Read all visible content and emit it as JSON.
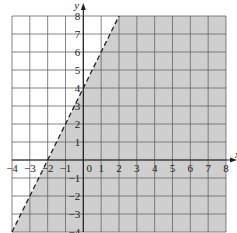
{
  "chart_data": {
    "type": "inequality-graph",
    "title": "",
    "xlabel": "x",
    "ylabel": "y",
    "xlim": [
      -4,
      8
    ],
    "ylim": [
      -4,
      8
    ],
    "grid": true,
    "x_ticks": [
      "-4",
      "-3",
      "-2",
      "-1",
      "0",
      "1",
      "2",
      "3",
      "4",
      "5",
      "6",
      "7",
      "8"
    ],
    "y_ticks": [
      "8",
      "7",
      "6",
      "5",
      "4",
      "3",
      "2",
      "1",
      "-1",
      "-2",
      "-3",
      "-4"
    ],
    "boundary": {
      "equation": "y = 2x + 4",
      "style": "dashed",
      "points": [
        [
          -4,
          -4
        ],
        [
          2,
          8
        ]
      ],
      "x_intercept": -2,
      "y_intercept": 4
    },
    "shaded_region": "y < 2x + 4 (right/below the line)",
    "colors": {
      "shade": "#cfcfcf",
      "grid": "#666666",
      "axis": "#222222",
      "line": "#222222"
    }
  }
}
